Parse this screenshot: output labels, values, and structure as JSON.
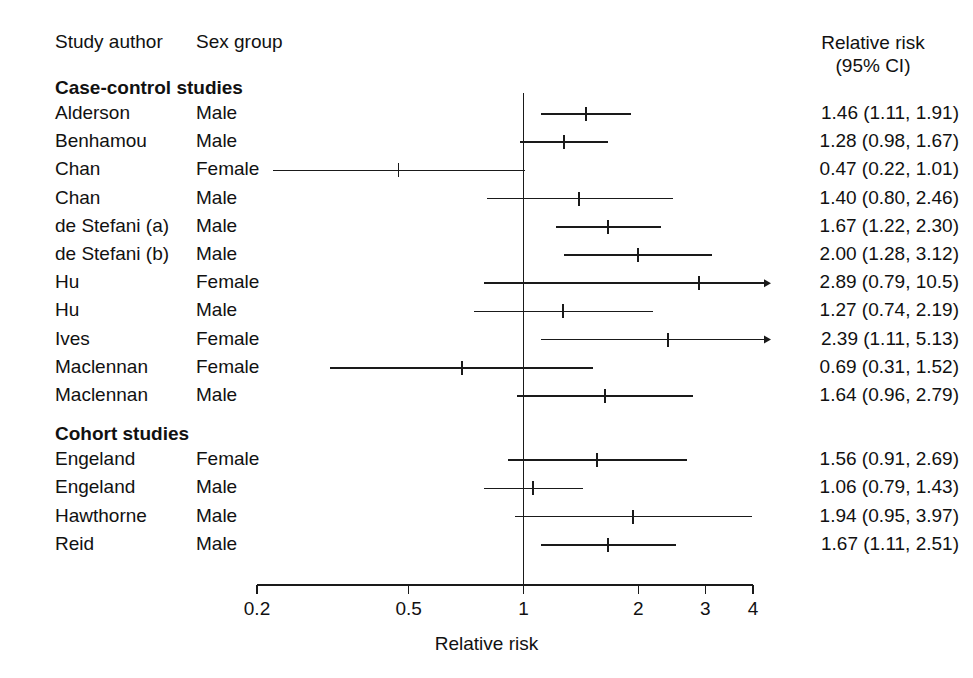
{
  "headers": {
    "author": "Study author",
    "sex": "Sex group",
    "rr_line1": "Relative risk",
    "rr_line2": "(95% CI)"
  },
  "axis": {
    "label": "Relative risk",
    "ticks": [
      "0.2",
      "0.5",
      "1",
      "2",
      "3",
      "4"
    ],
    "tick_values": [
      0.2,
      0.5,
      1,
      2,
      3,
      4
    ],
    "scale": "log",
    "xmin": 0.2,
    "xmax": 4,
    "reference_line": 1
  },
  "sections": [
    {
      "title": "Case-control studies"
    },
    {
      "title": "Cohort studies"
    }
  ],
  "chart_data": {
    "type": "forest",
    "title": "",
    "xlabel": "Relative risk",
    "ylabel": "",
    "xscale": "log",
    "xlim": [
      0.2,
      4
    ],
    "reference_line": 1,
    "tick_labels": [
      "0.2",
      "0.5",
      "1",
      "2",
      "3",
      "4"
    ],
    "tick_values": [
      0.2,
      0.5,
      1,
      2,
      3,
      4
    ],
    "columns": [
      "Study author",
      "Sex group",
      "Relative risk (95% CI)"
    ],
    "groups": [
      {
        "name": "Case-control studies",
        "rows": [
          {
            "author": "Alderson",
            "sex": "Male",
            "rr": 1.46,
            "lo": 1.11,
            "hi": 1.91,
            "text": "1.46 (1.11, 1.91)"
          },
          {
            "author": "Benhamou",
            "sex": "Male",
            "rr": 1.28,
            "lo": 0.98,
            "hi": 1.67,
            "text": "1.28 (0.98, 1.67)"
          },
          {
            "author": "Chan",
            "sex": "Female",
            "rr": 0.47,
            "lo": 0.22,
            "hi": 1.01,
            "text": "0.47 (0.22, 1.01)"
          },
          {
            "author": "Chan",
            "sex": "Male",
            "rr": 1.4,
            "lo": 0.8,
            "hi": 2.46,
            "text": "1.40 (0.80, 2.46)"
          },
          {
            "author": "de Stefani (a)",
            "sex": "Male",
            "rr": 1.67,
            "lo": 1.22,
            "hi": 2.3,
            "text": "1.67 (1.22, 2.30)"
          },
          {
            "author": "de Stefani (b)",
            "sex": "Male",
            "rr": 2.0,
            "lo": 1.28,
            "hi": 3.12,
            "text": "2.00 (1.28, 3.12)"
          },
          {
            "author": "Hu",
            "sex": "Female",
            "rr": 2.89,
            "lo": 0.79,
            "hi": 10.5,
            "text": "2.89 (0.79, 10.5)"
          },
          {
            "author": "Hu",
            "sex": "Male",
            "rr": 1.27,
            "lo": 0.74,
            "hi": 2.19,
            "text": "1.27 (0.74, 2.19)"
          },
          {
            "author": "Ives",
            "sex": "Female",
            "rr": 2.39,
            "lo": 1.11,
            "hi": 5.13,
            "text": "2.39 (1.11, 5.13)"
          },
          {
            "author": "Maclennan",
            "sex": "Female",
            "rr": 0.69,
            "lo": 0.31,
            "hi": 1.52,
            "text": "0.69 (0.31, 1.52)"
          },
          {
            "author": "Maclennan",
            "sex": "Male",
            "rr": 1.64,
            "lo": 0.96,
            "hi": 2.79,
            "text": "1.64 (0.96, 2.79)"
          }
        ]
      },
      {
        "name": "Cohort studies",
        "rows": [
          {
            "author": "Engeland",
            "sex": "Female",
            "rr": 1.56,
            "lo": 0.91,
            "hi": 2.69,
            "text": "1.56 (0.91, 2.69)"
          },
          {
            "author": "Engeland",
            "sex": "Male",
            "rr": 1.06,
            "lo": 0.79,
            "hi": 1.43,
            "text": "1.06 (0.79, 1.43)"
          },
          {
            "author": "Hawthorne",
            "sex": "Male",
            "rr": 1.94,
            "lo": 0.95,
            "hi": 3.97,
            "text": "1.94 (0.95, 3.97)"
          },
          {
            "author": "Reid",
            "sex": "Male",
            "rr": 1.67,
            "lo": 1.11,
            "hi": 2.51,
            "text": "1.67 (1.11, 2.51)"
          }
        ]
      }
    ]
  },
  "colors": {
    "ink": "#111111",
    "line": "#1a1a1a",
    "background": "#ffffff"
  }
}
